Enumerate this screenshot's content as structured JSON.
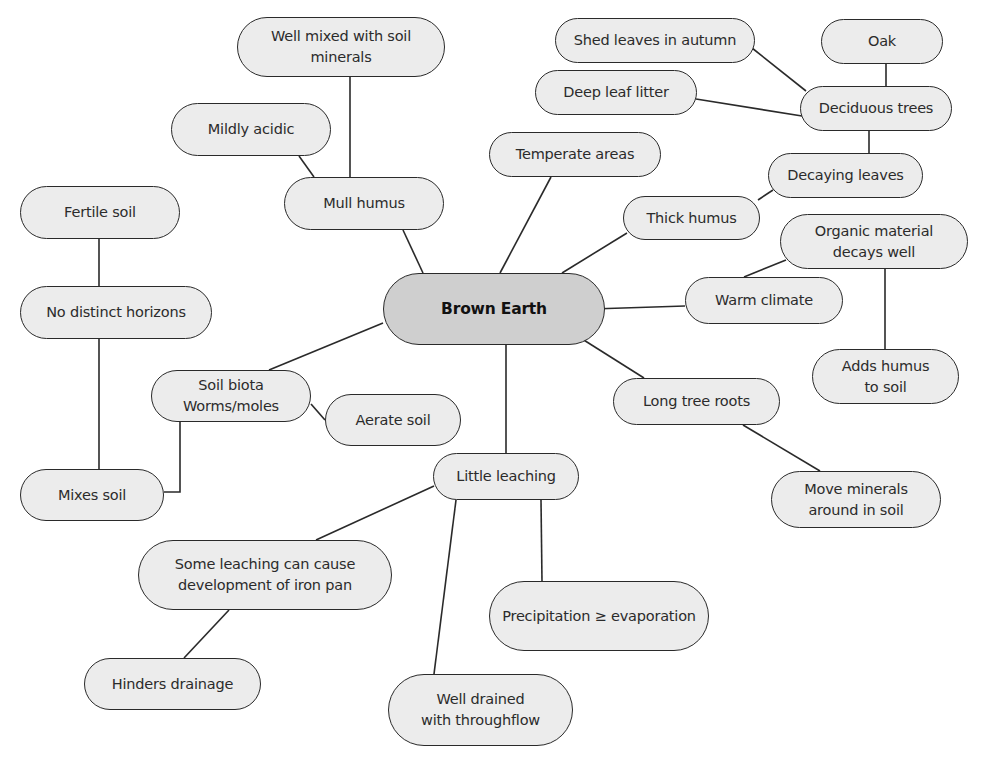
{
  "diagram": {
    "type": "mind-map",
    "central": {
      "id": "brown_earth",
      "label": "Brown Earth"
    },
    "colors": {
      "node_fill": "#ececec",
      "central_fill": "#cfcfcf",
      "stroke": "#2a2a2a",
      "text": "#2b2b2b"
    },
    "nodes": [
      {
        "id": "brown_earth",
        "label": "Brown Earth",
        "x": 383,
        "y": 273,
        "w": 222,
        "h": 72,
        "central": true
      },
      {
        "id": "well_mixed",
        "label": "Well mixed with soil\nminerals",
        "x": 237,
        "y": 17,
        "w": 208,
        "h": 60
      },
      {
        "id": "mildly_acidic",
        "label": "Mildly acidic",
        "x": 171,
        "y": 103,
        "w": 160,
        "h": 53
      },
      {
        "id": "mull_humus",
        "label": "Mull humus",
        "x": 284,
        "y": 177,
        "w": 160,
        "h": 53
      },
      {
        "id": "fertile_soil",
        "label": "Fertile soil",
        "x": 20,
        "y": 186,
        "w": 160,
        "h": 53
      },
      {
        "id": "no_horizons",
        "label": "No distinct horizons",
        "x": 20,
        "y": 286,
        "w": 192,
        "h": 53
      },
      {
        "id": "shed_leaves",
        "label": "Shed leaves in autumn",
        "x": 555,
        "y": 18,
        "w": 200,
        "h": 45
      },
      {
        "id": "oak",
        "label": "Oak",
        "x": 821,
        "y": 19,
        "w": 122,
        "h": 45
      },
      {
        "id": "deep_litter",
        "label": "Deep leaf litter",
        "x": 535,
        "y": 70,
        "w": 162,
        "h": 45
      },
      {
        "id": "deciduous",
        "label": "Deciduous trees",
        "x": 800,
        "y": 86,
        "w": 152,
        "h": 45
      },
      {
        "id": "temperate",
        "label": "Temperate areas",
        "x": 489,
        "y": 132,
        "w": 172,
        "h": 45
      },
      {
        "id": "decaying",
        "label": "Decaying leaves",
        "x": 768,
        "y": 153,
        "w": 155,
        "h": 45
      },
      {
        "id": "thick_humus",
        "label": "Thick humus",
        "x": 623,
        "y": 196,
        "w": 137,
        "h": 44
      },
      {
        "id": "organic",
        "label": "Organic material\ndecays well",
        "x": 780,
        "y": 214,
        "w": 188,
        "h": 55
      },
      {
        "id": "warm_climate",
        "label": "Warm climate",
        "x": 685,
        "y": 277,
        "w": 158,
        "h": 47
      },
      {
        "id": "adds_humus",
        "label": "Adds humus\nto soil",
        "x": 812,
        "y": 349,
        "w": 147,
        "h": 55
      },
      {
        "id": "soil_biota",
        "label": "Soil biota\nWorms/moles",
        "x": 151,
        "y": 370,
        "w": 160,
        "h": 52
      },
      {
        "id": "aerate",
        "label": "Aerate soil",
        "x": 325,
        "y": 394,
        "w": 136,
        "h": 52
      },
      {
        "id": "long_roots",
        "label": "Long tree roots",
        "x": 613,
        "y": 378,
        "w": 167,
        "h": 47
      },
      {
        "id": "little_leaching",
        "label": "Little leaching",
        "x": 433,
        "y": 453,
        "w": 146,
        "h": 47
      },
      {
        "id": "mixes_soil",
        "label": "Mixes soil",
        "x": 20,
        "y": 469,
        "w": 144,
        "h": 52
      },
      {
        "id": "move_minerals",
        "label": "Move minerals\naround in soil",
        "x": 771,
        "y": 471,
        "w": 170,
        "h": 57
      },
      {
        "id": "iron_pan",
        "label": "Some leaching can cause\ndevelopment of iron pan",
        "x": 138,
        "y": 540,
        "w": 254,
        "h": 70
      },
      {
        "id": "precip",
        "label": "Precipitation ≥ evaporation",
        "x": 489,
        "y": 581,
        "w": 220,
        "h": 70
      },
      {
        "id": "hinders",
        "label": "Hinders drainage",
        "x": 84,
        "y": 658,
        "w": 177,
        "h": 52
      },
      {
        "id": "well_drained",
        "label": "Well drained\nwith throughflow",
        "x": 388,
        "y": 674,
        "w": 185,
        "h": 72
      }
    ],
    "edges": [
      {
        "from": "well_mixed",
        "to": "mull_humus",
        "points": [
          [
            350,
            77
          ],
          [
            350,
            177
          ]
        ]
      },
      {
        "from": "mildly_acidic",
        "to": "mull_humus",
        "points": [
          [
            299,
            156
          ],
          [
            314,
            177
          ]
        ]
      },
      {
        "from": "mull_humus",
        "to": "brown_earth",
        "points": [
          [
            403,
            230
          ],
          [
            423,
            273
          ]
        ]
      },
      {
        "from": "fertile_soil",
        "to": "no_horizons",
        "points": [
          [
            99,
            239
          ],
          [
            99,
            286
          ]
        ]
      },
      {
        "from": "no_horizons",
        "to": "mixes_soil",
        "points": [
          [
            99,
            339
          ],
          [
            99,
            469
          ]
        ]
      },
      {
        "from": "soil_biota",
        "to": "mixes_soil",
        "points": [
          [
            180,
            422
          ],
          [
            180,
            492
          ],
          [
            164,
            492
          ]
        ]
      },
      {
        "from": "brown_earth",
        "to": "soil_biota",
        "points": [
          [
            383,
            323
          ],
          [
            269,
            370
          ]
        ]
      },
      {
        "from": "soil_biota",
        "to": "aerate",
        "points": [
          [
            311,
            404
          ],
          [
            325,
            420
          ]
        ]
      },
      {
        "from": "temperate",
        "to": "brown_earth",
        "points": [
          [
            551,
            177
          ],
          [
            500,
            273
          ]
        ]
      },
      {
        "from": "shed_leaves",
        "to": "deciduous",
        "points": [
          [
            752,
            48
          ],
          [
            806,
            91
          ]
        ]
      },
      {
        "from": "deep_litter",
        "to": "deciduous",
        "points": [
          [
            696,
            99
          ],
          [
            802,
            116
          ]
        ]
      },
      {
        "from": "oak",
        "to": "deciduous",
        "points": [
          [
            886,
            64
          ],
          [
            886,
            86
          ]
        ]
      },
      {
        "from": "deciduous",
        "to": "decaying",
        "points": [
          [
            869,
            131
          ],
          [
            869,
            153
          ]
        ]
      },
      {
        "from": "decaying",
        "to": "thick_humus",
        "points": [
          [
            773,
            190
          ],
          [
            758,
            200
          ]
        ]
      },
      {
        "from": "thick_humus",
        "to": "brown_earth",
        "points": [
          [
            627,
            233
          ],
          [
            562,
            273
          ]
        ]
      },
      {
        "from": "brown_earth",
        "to": "warm_climate",
        "points": [
          [
            592,
            309
          ],
          [
            685,
            306
          ]
        ]
      },
      {
        "from": "warm_climate",
        "to": "organic",
        "points": [
          [
            744,
            277
          ],
          [
            786,
            260
          ]
        ]
      },
      {
        "from": "organic",
        "to": "adds_humus",
        "points": [
          [
            885,
            269
          ],
          [
            885,
            349
          ]
        ]
      },
      {
        "from": "brown_earth",
        "to": "long_roots",
        "points": [
          [
            579,
            337
          ],
          [
            644,
            378
          ]
        ]
      },
      {
        "from": "long_roots",
        "to": "move_minerals",
        "points": [
          [
            743,
            425
          ],
          [
            820,
            471
          ]
        ]
      },
      {
        "from": "brown_earth",
        "to": "little_leaching",
        "points": [
          [
            506,
            345
          ],
          [
            506,
            453
          ]
        ]
      },
      {
        "from": "little_leaching",
        "to": "iron_pan",
        "points": [
          [
            434,
            486
          ],
          [
            316,
            540
          ]
        ]
      },
      {
        "from": "little_leaching",
        "to": "well_drained",
        "points": [
          [
            456,
            500
          ],
          [
            434,
            674
          ]
        ]
      },
      {
        "from": "little_leaching",
        "to": "precip",
        "points": [
          [
            541,
            500
          ],
          [
            542,
            581
          ]
        ]
      },
      {
        "from": "iron_pan",
        "to": "hinders",
        "points": [
          [
            229,
            610
          ],
          [
            184,
            658
          ]
        ]
      }
    ]
  }
}
